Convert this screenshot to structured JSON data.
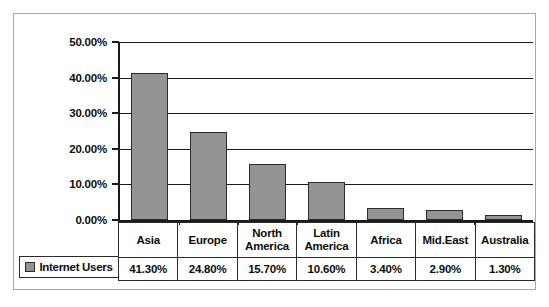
{
  "chart_data": {
    "type": "bar",
    "title": "",
    "xlabel": "",
    "ylabel": "",
    "categories": [
      "Asia",
      "Europe",
      "North America",
      "Latin America",
      "Africa",
      "Mid.East",
      "Australia"
    ],
    "series": [
      {
        "name": "Internet Users",
        "values": [
          41.3,
          24.8,
          15.7,
          10.6,
          3.4,
          2.9,
          1.3
        ],
        "value_labels": [
          "41.30%",
          "24.80%",
          "15.70%",
          "10.60%",
          "3.40%",
          "2.90%",
          "1.30%"
        ],
        "color": "#949494"
      }
    ],
    "ylim": [
      0,
      50
    ],
    "ytick_values": [
      50,
      40,
      30,
      20,
      10,
      0
    ],
    "ytick_labels": [
      "50.00%",
      "40.00%",
      "30.00%",
      "20.00%",
      "10.00%",
      "0.00%"
    ],
    "grid": true,
    "legend_position": "bottom-left",
    "table_below": true
  },
  "legend": {
    "series_label": "Internet Users",
    "swatch_color": "#949494"
  },
  "colors": {
    "bar_fill": "#949494",
    "bar_border": "#2b2b2b",
    "axis": "#1a1a1a",
    "frame": "#a8a8a8",
    "text": "#0d0d0d",
    "background": "#ffffff"
  }
}
